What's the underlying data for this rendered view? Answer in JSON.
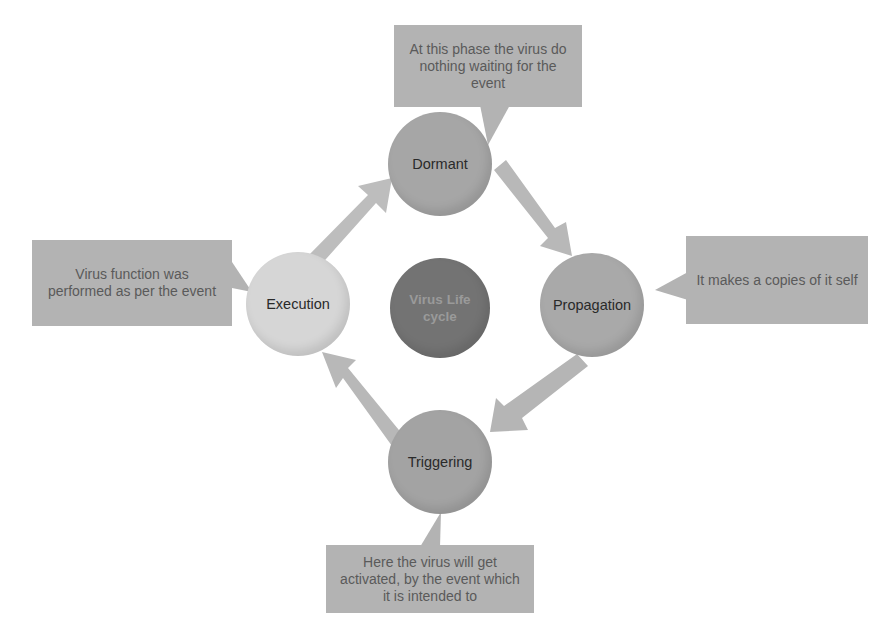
{
  "diagram": {
    "title": "Virus Life cycle",
    "center": {
      "label": "Virus Life cycle",
      "line1": "Virus Life",
      "line2": "cycle",
      "color": "#737373"
    },
    "phases": [
      {
        "id": "dormant",
        "label": "Dormant",
        "color": "#a6a6a6",
        "description": "At this phase the virus do nothing waiting for the event"
      },
      {
        "id": "propagation",
        "label": "Propagation",
        "color": "#a9a9a9",
        "description": "It makes a copies of it self"
      },
      {
        "id": "triggering",
        "label": "Triggering",
        "color": "#a3a3a3",
        "description": "Here the virus will get activated, by the event which it is intended to"
      },
      {
        "id": "execution",
        "label": "Execution",
        "color": "#d6d6d6",
        "description": "Virus function was performed as per the event"
      }
    ],
    "flow": [
      "Dormant",
      "Propagation",
      "Triggering",
      "Execution",
      "Dormant"
    ],
    "arrow_color": "#b8b8b8",
    "callout_color": "#b3b3b3"
  }
}
